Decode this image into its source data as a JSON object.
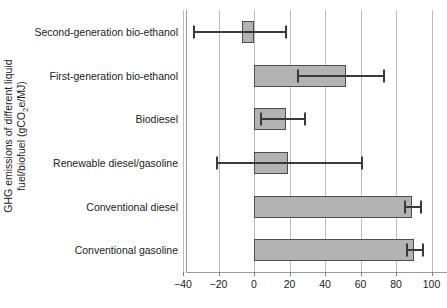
{
  "chart_data": {
    "type": "bar",
    "orientation": "horizontal",
    "title": "",
    "xlabel": "",
    "ylabel": "GHG emissions of different liquid fuel/biofuel (gCO2e/MJ)",
    "ylabel_line1": "GHG emissions of different liquid",
    "ylabel_line2_pre": "fuel/biofuel (gCO",
    "ylabel_line2_sub": "2",
    "ylabel_line2_post": "e/MJ)",
    "xlim": [
      -42,
      104
    ],
    "xticks": [
      -40,
      -20,
      0,
      20,
      40,
      60,
      80,
      100
    ],
    "xticklabels": [
      "-40",
      "-20",
      "0",
      "20",
      "40",
      "60",
      "80",
      "100"
    ],
    "grid": "vertical gridlines at each x tick",
    "legend": "none",
    "bar_fill_color": "#b3b3b3",
    "bar_edge_color": "#4d4d4d",
    "errorbar_color": "#3a3a3a",
    "gridline_color": "#bdbdbd",
    "categories": [
      "Second-generation bio-ethanol",
      "First-generation bio-ethanol",
      "Biodiesel",
      "Renewable diesel/gasoline",
      "Conventional diesel",
      "Conventional gasoline"
    ],
    "values": [
      -7,
      52,
      18,
      19,
      89,
      90
    ],
    "err_low": [
      -34,
      25,
      4,
      -21,
      85,
      86
    ],
    "err_high": [
      18,
      73,
      29,
      61,
      94,
      95
    ],
    "points": [
      {
        "category": "Second-generation bio-ethanol",
        "value": -7,
        "low": -34,
        "high": 18
      },
      {
        "category": "First-generation bio-ethanol",
        "value": 52,
        "low": 25,
        "high": 73
      },
      {
        "category": "Biodiesel",
        "value": 18,
        "low": 4,
        "high": 29
      },
      {
        "category": "Renewable diesel/gasoline",
        "value": 19,
        "low": -21,
        "high": 61
      },
      {
        "category": "Conventional diesel",
        "value": 89,
        "low": 85,
        "high": 94
      },
      {
        "category": "Conventional gasoline",
        "value": 90,
        "low": 86,
        "high": 95
      }
    ]
  }
}
